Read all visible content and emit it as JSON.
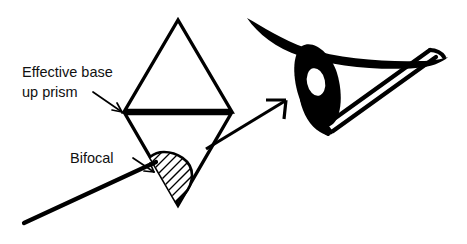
{
  "figure": {
    "background_color": "#ffffff",
    "ink_color": "#000000",
    "width": 467,
    "height": 244,
    "labels": {
      "prism_label_line1": "Effective base",
      "prism_label_line2": "up prism",
      "bifocal_label": "Bifocal"
    },
    "annotations": [
      {
        "name": "effective-base-up-prism",
        "text": "Effective base up prism",
        "points_to": "prism-base-line",
        "leader": "elbow-line-with-arrowhead"
      },
      {
        "name": "bifocal",
        "text": "Bifocal",
        "points_to": "bifocal-segment",
        "leader": "elbow-line-with-arrowhead"
      }
    ],
    "shapes": [
      {
        "name": "prism-diamond",
        "type": "kite",
        "description": "Two triangles joined at a horizontal mid line, apex up and apex down",
        "apex_top": [
          178,
          20
        ],
        "vertex_left": [
          124,
          112
        ],
        "vertex_right": [
          232,
          112
        ],
        "apex_bottom": [
          178,
          205
        ],
        "stroke_width": 3.4
      },
      {
        "name": "prism-base-line",
        "type": "thick-horizontal-line",
        "from": [
          124,
          112
        ],
        "to": [
          232,
          112
        ],
        "stroke_width": 6.5
      },
      {
        "name": "bifocal-segment",
        "type": "hatched-half-disc",
        "description": "Half moon D-shape with diagonal hatching at the lower left edge of the prism",
        "flat_edge_from": [
          152,
          158
        ],
        "flat_edge_to": [
          176,
          200
        ],
        "hatch_angle_deg": 45,
        "hatch_spacing": 5
      },
      {
        "name": "spectacle-lens-line",
        "type": "long-diagonal-line",
        "from": [
          24,
          223
        ],
        "to": [
          156,
          163
        ],
        "stroke_width": 4.2
      },
      {
        "name": "transfer-arrow",
        "type": "arrow",
        "from": [
          208,
          148
        ],
        "to": [
          288,
          100
        ],
        "stroke_width": 3.2
      },
      {
        "name": "eye",
        "type": "eye-profile",
        "description": "Side profile of an eye with upper lid sweep, dark iris with white highlight, and a prism drawn as double parallel lines",
        "iris_center": [
          325,
          85
        ],
        "iris_highlight": [
          317,
          83
        ]
      }
    ]
  }
}
